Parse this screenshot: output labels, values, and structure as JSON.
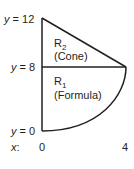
{
  "diagram": {
    "y_labels": [
      {
        "var": "y",
        "eq": " = 12"
      },
      {
        "var": "y",
        "eq": " = 8"
      },
      {
        "var": "y",
        "eq": " = 0"
      }
    ],
    "x_axis": {
      "var": "x",
      "sep": ":",
      "ticks": [
        "0",
        "4"
      ]
    },
    "regions": [
      {
        "name": "R",
        "sub": "2",
        "desc": "(Cone)"
      },
      {
        "name": "R",
        "sub": "1",
        "desc": "(Formula)"
      }
    ],
    "stroke_color": "#231f20"
  }
}
